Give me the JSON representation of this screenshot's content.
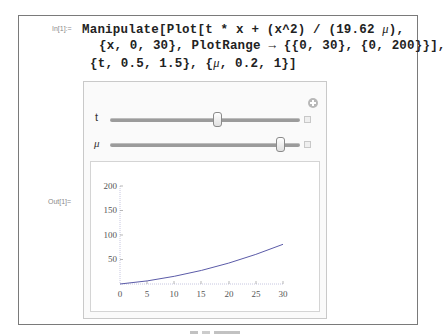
{
  "cell": {
    "in_label": "In[1]:=",
    "out_label": "Out[1]=",
    "code_lines": [
      "Manipulate[Plot[t * x + (x^2) / (19.62 μ),",
      "{x, 0, 30}, PlotRange → {{0, 30}, {0, 200}}],",
      "{t, 0.5, 1.5}, {μ, 0.2, 1}]"
    ]
  },
  "manipulate": {
    "add_icon": "plus-circle-icon",
    "controls": [
      {
        "label": "t",
        "min": 0.5,
        "max": 1.5,
        "value": 1.0,
        "expand_icon": "plus-square-icon"
      },
      {
        "label": "μ",
        "min": 0.2,
        "max": 1,
        "value": 0.9,
        "expand_icon": "plus-square-icon"
      }
    ]
  },
  "colors": {
    "curve": "#5b5ba8",
    "axis": "#aaaacc",
    "frame": "#7a7a7a"
  },
  "chart_data": {
    "type": "line",
    "title": "",
    "xlabel": "",
    "ylabel": "",
    "xlim": [
      0,
      30
    ],
    "ylim": [
      0,
      200
    ],
    "x_ticks": [
      0,
      5,
      10,
      15,
      20,
      25,
      30
    ],
    "y_ticks": [
      50,
      100,
      150,
      200
    ],
    "x_tick_labels": [
      "0",
      "5",
      "10",
      "15",
      "20",
      "25",
      "30"
    ],
    "y_tick_labels": [
      "50",
      "100",
      "150",
      "200"
    ],
    "grid": false,
    "series": [
      {
        "name": "t*x + x^2/(19.62 μ)",
        "x": [
          0,
          5,
          10,
          15,
          20,
          25,
          30
        ],
        "values": [
          0,
          6.4,
          15.7,
          27.7,
          42.7,
          60.4,
          81.0
        ]
      }
    ]
  }
}
